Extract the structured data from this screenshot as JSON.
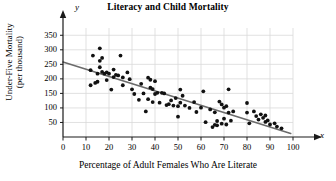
{
  "chart_data": {
    "type": "scatter",
    "title": "Literacy and Child Mortality",
    "xlabel": "Percentage of Adult Females Who Are Literate",
    "ylabel_line1": "Under-Five Mortality",
    "ylabel_line2": "(per thousand)",
    "x_var": "x",
    "y_var": "y",
    "xlim": [
      0,
      100
    ],
    "ylim": [
      0,
      375
    ],
    "xticks": [
      0,
      10,
      20,
      30,
      40,
      50,
      60,
      70,
      80,
      90,
      100
    ],
    "yticks": [
      50,
      100,
      150,
      200,
      250,
      300,
      350
    ],
    "grid": true,
    "legend": "none",
    "colors": {
      "point": "#111111",
      "trendline": "#6b6b6b",
      "grid": "#d9d9d9",
      "axis": "#1a1a1a"
    },
    "trendline": {
      "type": "linear",
      "x_start": 0,
      "y_start": 258,
      "x_end": 99,
      "y_end": 12
    },
    "points": [
      [
        12,
        230
      ],
      [
        12,
        178
      ],
      [
        13,
        280
      ],
      [
        14,
        186
      ],
      [
        15,
        218
      ],
      [
        15,
        190
      ],
      [
        16,
        305
      ],
      [
        16,
        262
      ],
      [
        16,
        240
      ],
      [
        17,
        272
      ],
      [
        17,
        224
      ],
      [
        18,
        218
      ],
      [
        19,
        222
      ],
      [
        19,
        196
      ],
      [
        20,
        218
      ],
      [
        21,
        163
      ],
      [
        22,
        232
      ],
      [
        22,
        206
      ],
      [
        23,
        214
      ],
      [
        24,
        212
      ],
      [
        25,
        280
      ],
      [
        26,
        205
      ],
      [
        26,
        178
      ],
      [
        28,
        222
      ],
      [
        29,
        199
      ],
      [
        30,
        164
      ],
      [
        31,
        148
      ],
      [
        33,
        128
      ],
      [
        34,
        183
      ],
      [
        35,
        150
      ],
      [
        36,
        88
      ],
      [
        37,
        204
      ],
      [
        37,
        130
      ],
      [
        38,
        197
      ],
      [
        38,
        170
      ],
      [
        39,
        165
      ],
      [
        39,
        120
      ],
      [
        40,
        192
      ],
      [
        40,
        148
      ],
      [
        41,
        152
      ],
      [
        42,
        118
      ],
      [
        43,
        152
      ],
      [
        44,
        150
      ],
      [
        45,
        110
      ],
      [
        46,
        113
      ],
      [
        47,
        126
      ],
      [
        48,
        108
      ],
      [
        49,
        134
      ],
      [
        50,
        106
      ],
      [
        50,
        70
      ],
      [
        51,
        163
      ],
      [
        51,
        118
      ],
      [
        52,
        142
      ],
      [
        53,
        108
      ],
      [
        55,
        100
      ],
      [
        57,
        120
      ],
      [
        58,
        86
      ],
      [
        60,
        101
      ],
      [
        61,
        157
      ],
      [
        62,
        51
      ],
      [
        64,
        95
      ],
      [
        65,
        34
      ],
      [
        66,
        85
      ],
      [
        66,
        42
      ],
      [
        67,
        55
      ],
      [
        67,
        40
      ],
      [
        68,
        122
      ],
      [
        69,
        112
      ],
      [
        69,
        46
      ],
      [
        70,
        101
      ],
      [
        70,
        63
      ],
      [
        71,
        106
      ],
      [
        71,
        43
      ],
      [
        72,
        164
      ],
      [
        72,
        84
      ],
      [
        73,
        56
      ],
      [
        74,
        88
      ],
      [
        80,
        117
      ],
      [
        80,
        84
      ],
      [
        81,
        47
      ],
      [
        83,
        88
      ],
      [
        84,
        72
      ],
      [
        85,
        60
      ],
      [
        86,
        78
      ],
      [
        87,
        66
      ],
      [
        88,
        74
      ],
      [
        88,
        52
      ],
      [
        89,
        57
      ],
      [
        90,
        43
      ],
      [
        92,
        47
      ],
      [
        93,
        36
      ],
      [
        95,
        30
      ]
    ]
  }
}
